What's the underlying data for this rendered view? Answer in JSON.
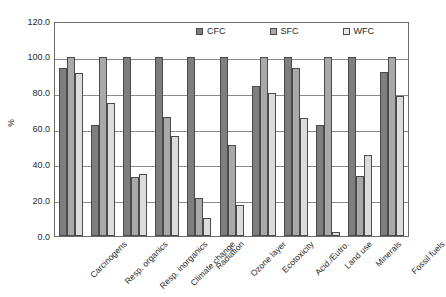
{
  "chart_data": {
    "type": "bar",
    "title": "",
    "subtitle": "",
    "xlabel": "",
    "ylabel": "%",
    "ylim": [
      0,
      120
    ],
    "ytick_labels": [
      "0.0",
      "20.0",
      "40.0",
      "60.0",
      "80.0",
      "100.0",
      "120.0"
    ],
    "ytick_values": [
      0,
      20,
      40,
      60,
      80,
      100,
      120
    ],
    "grid": "horizontal",
    "legend_position": "top",
    "categories": [
      "Carcinogens",
      "Resp. organics",
      "Resp. inorganics",
      "Climate change",
      "Radiation",
      "Ozone layer",
      "Ecotoxicity",
      "Acid./Eutro.",
      "Land use",
      "Minerals",
      "Fossil fuels"
    ],
    "series": [
      {
        "name": "CFC",
        "color": "#7e7e7e",
        "values": [
          93.5,
          62.0,
          100.0,
          100.0,
          100.0,
          100.0,
          83.5,
          100.0,
          62.0,
          100.0,
          91.5
        ]
      },
      {
        "name": "SFC",
        "color": "#a9a9a9",
        "values": [
          100.0,
          100.0,
          33.0,
          66.5,
          21.0,
          51.0,
          100.0,
          93.5,
          100.0,
          33.5,
          100.0
        ]
      },
      {
        "name": "WFC",
        "color": "#dcdcdc",
        "values": [
          91.0,
          74.0,
          34.5,
          56.0,
          10.0,
          17.5,
          80.0,
          66.0,
          2.5,
          45.0,
          78.0
        ]
      }
    ]
  },
  "legend": {
    "items": [
      {
        "label": "CFC"
      },
      {
        "label": "SFC"
      },
      {
        "label": "WFC"
      }
    ]
  }
}
